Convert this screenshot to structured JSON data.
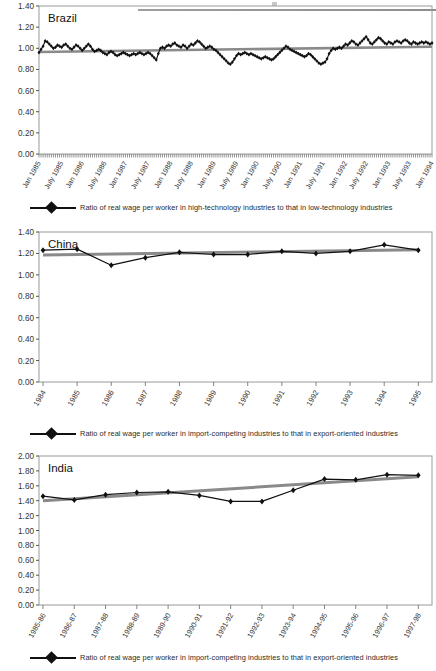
{
  "figure": {
    "panels": [
      "Brazil",
      "China",
      "India"
    ],
    "axis_label_color": "#333333",
    "series_color": "#111111",
    "trend_color": "#8a8a8a",
    "frame_color": "#9a9a9a"
  },
  "panel_brazil": {
    "title": "Brazil",
    "legend": "Ratio of real wage per worker in high-technology industries to that in low-technology industries",
    "legend_marker": "diamond-line-marker"
  },
  "panel_china": {
    "title": "China",
    "legend": "Ratio of real wage per worker in import-competing industries to that in export-oriented industries",
    "legend_marker": "diamond-line-marker"
  },
  "panel_india": {
    "title": "India",
    "legend": "Ratio of real wage per worker in import-competing industries to that in export-oriented industries",
    "legend_marker": "diamond-line-marker"
  },
  "chart_data": [
    {
      "type": "line",
      "title": "Brazil",
      "xlabel": "",
      "ylabel": "",
      "ylim": [
        0.0,
        1.4
      ],
      "yticks": [
        "0.00",
        "0.20",
        "0.40",
        "0.60",
        "0.80",
        "1.00",
        "1.20",
        "1.40"
      ],
      "grid": false,
      "legend_position": "below",
      "series": [
        {
          "name": "Ratio of real wage per worker in high-technology industries to that in low-technology industries",
          "marker": "diamond",
          "values": [
            0.96,
            0.99,
            1.02,
            1.07,
            1.06,
            1.04,
            1.02,
            1.0,
            1.01,
            1.03,
            1.02,
            1.01,
            1.03,
            1.04,
            1.02,
            1.0,
            0.99,
            1.01,
            1.03,
            1.02,
            1.0,
            0.98,
            1.0,
            1.02,
            1.04,
            1.02,
            0.99,
            0.97,
            0.98,
            0.99,
            0.98,
            0.96,
            0.95,
            0.94,
            0.96,
            0.97,
            0.96,
            0.94,
            0.93,
            0.94,
            0.95,
            0.96,
            0.95,
            0.94,
            0.93,
            0.94,
            0.95,
            0.94,
            0.95,
            0.96,
            0.95,
            0.94,
            0.95,
            0.96,
            0.95,
            0.93,
            0.91,
            0.89,
            0.95,
            1.0,
            1.01,
            1.0,
            1.02,
            1.03,
            1.02,
            1.04,
            1.05,
            1.03,
            1.02,
            1.01,
            1.03,
            1.02,
            1.0,
            1.02,
            1.04,
            1.03,
            1.05,
            1.07,
            1.06,
            1.04,
            1.02,
            1.0,
            1.01,
            1.02,
            1.01,
            0.99,
            0.98,
            0.96,
            0.94,
            0.92,
            0.9,
            0.88,
            0.86,
            0.85,
            0.87,
            0.9,
            0.93,
            0.95,
            0.94,
            0.95,
            0.96,
            0.95,
            0.94,
            0.95,
            0.94,
            0.93,
            0.92,
            0.91,
            0.9,
            0.91,
            0.92,
            0.91,
            0.9,
            0.89,
            0.9,
            0.92,
            0.94,
            0.96,
            0.98,
            1.0,
            1.02,
            1.01,
            0.99,
            0.98,
            0.97,
            0.96,
            0.95,
            0.94,
            0.93,
            0.92,
            0.93,
            0.95,
            0.94,
            0.92,
            0.9,
            0.88,
            0.86,
            0.85,
            0.86,
            0.87,
            0.9,
            0.95,
            0.98,
            1.0,
            0.99,
            1.0,
            1.01,
            1.0,
            1.02,
            1.04,
            1.03,
            1.05,
            1.07,
            1.06,
            1.04,
            1.03,
            1.05,
            1.07,
            1.09,
            1.11,
            1.08,
            1.05,
            1.04,
            1.06,
            1.08,
            1.1,
            1.09,
            1.07,
            1.05,
            1.04,
            1.06,
            1.05,
            1.04,
            1.06,
            1.07,
            1.06,
            1.05,
            1.07,
            1.08,
            1.07,
            1.05,
            1.04,
            1.06,
            1.05,
            1.04,
            1.05,
            1.06,
            1.05,
            1.06,
            1.05,
            1.04,
            1.05
          ]
        },
        {
          "name": "trend",
          "marker": "none",
          "values_endpoints": [
            0.965,
            1.015
          ]
        }
      ],
      "categories": [
        "Jan 1985",
        "July 1985",
        "Jan 1986",
        "July 1986",
        "Jan 1987",
        "July 1987",
        "Jan 1988",
        "July 1988",
        "Jan 1989",
        "July 1989",
        "Jan 1990",
        "July 1990",
        "Jan 1991",
        "July 1991",
        "Jan 1992",
        "July 1992",
        "Jan 1993",
        "July 1993",
        "Jan 1994"
      ]
    },
    {
      "type": "line",
      "title": "China",
      "xlabel": "",
      "ylabel": "",
      "ylim": [
        0.0,
        1.4
      ],
      "yticks": [
        "0.00",
        "0.20",
        "0.40",
        "0.60",
        "0.80",
        "1.00",
        "1.20",
        "1.40"
      ],
      "grid": false,
      "legend_position": "below",
      "categories": [
        "1984",
        "1985",
        "1986",
        "1987",
        "1988",
        "1989",
        "1990",
        "1991",
        "1992",
        "1993",
        "1994",
        "1995"
      ],
      "series": [
        {
          "name": "Ratio of real wage per worker in import-competing industries to that in export-oriented industries",
          "marker": "diamond",
          "values": [
            1.23,
            1.24,
            1.09,
            1.16,
            1.21,
            1.19,
            1.19,
            1.22,
            1.2,
            1.22,
            1.28,
            1.23
          ]
        },
        {
          "name": "trend",
          "marker": "none",
          "values_endpoints": [
            1.185,
            1.235
          ]
        }
      ]
    },
    {
      "type": "line",
      "title": "India",
      "xlabel": "",
      "ylabel": "",
      "ylim": [
        0.0,
        2.0
      ],
      "yticks": [
        "0.00",
        "0.20",
        "0.40",
        "0.60",
        "0.80",
        "1.00",
        "1.20",
        "1.40",
        "1.60",
        "1.80",
        "2.00"
      ],
      "grid": false,
      "legend_position": "below",
      "categories": [
        "1985-86",
        "1986-87",
        "1987-88",
        "1988-89",
        "1989-90",
        "1990-91",
        "1991-92",
        "1992-93",
        "1993-94",
        "1994-95",
        "1995-96",
        "1996-97",
        "1997-98"
      ],
      "series": [
        {
          "name": "Ratio of real wage per worker in import-competing industries to that in export-oriented industries",
          "marker": "diamond",
          "values": [
            1.46,
            1.41,
            1.48,
            1.51,
            1.52,
            1.47,
            1.39,
            1.39,
            1.54,
            1.69,
            1.68,
            1.75,
            1.74
          ]
        },
        {
          "name": "trend",
          "marker": "none",
          "values_endpoints": [
            1.4,
            1.72
          ]
        }
      ]
    }
  ]
}
